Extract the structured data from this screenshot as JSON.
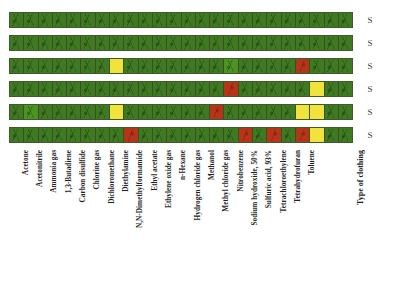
{
  "figure": {
    "row_tag_label": "S",
    "column_header": "Type of clothing",
    "colors": {
      "green": "#3f7a22",
      "bright_green": "#4b9424",
      "yellow": "#f2e23c",
      "red": "#b63418",
      "border": "#3d5a28"
    }
  },
  "chart_data": {
    "type": "heatmap",
    "title": "",
    "xlabel": "",
    "ylabel": "",
    "legend": [],
    "grid": true,
    "row_labels": [
      "S",
      "S",
      "S",
      "S",
      "S",
      "S"
    ],
    "categories": [
      "Acetone",
      "Acetonitrile",
      "Ammonia gas",
      "1,3-Butadiene",
      "Carbon disulfide",
      "Chlorine gas",
      "Dichloromethane",
      "Diethylamine",
      "N,N-Dimethylformamide",
      "Ethyl acetate",
      "Ethylene oxide gas",
      "n-Hexane",
      "Hydrogen chloride gas",
      "Methanol",
      "Methyl chloride gas",
      "Nitrobenzene",
      "Sodium hydroxide, 50%",
      "Sulfuric acid, 93%",
      "Tetrachloroethylene",
      "Tetrahydrofuran",
      "Toluene"
    ],
    "column_count": 24,
    "cell_states": [
      [
        "green",
        "green",
        "green",
        "green",
        "green",
        "green",
        "green",
        "green",
        "green",
        "green",
        "green",
        "green",
        "green",
        "green",
        "green",
        "green",
        "green",
        "green",
        "green",
        "green",
        "green",
        "green",
        "green",
        "green"
      ],
      [
        "green",
        "green",
        "green",
        "green",
        "green",
        "green",
        "green",
        "green",
        "green",
        "green",
        "green",
        "green",
        "green",
        "green",
        "green",
        "green",
        "green",
        "green",
        "green",
        "green",
        "green",
        "green",
        "green",
        "green"
      ],
      [
        "green",
        "green",
        "green",
        "green",
        "green",
        "green",
        "green",
        "yellow",
        "green",
        "green",
        "green",
        "green",
        "green",
        "green",
        "green",
        "bright_green",
        "green",
        "green",
        "green",
        "green",
        "red",
        "green",
        "green",
        "green"
      ],
      [
        "green",
        "green",
        "green",
        "green",
        "green",
        "green",
        "green",
        "green",
        "green",
        "green",
        "green",
        "green",
        "green",
        "green",
        "green",
        "red",
        "green",
        "green",
        "green",
        "green",
        "green",
        "yellow",
        "green",
        "green"
      ],
      [
        "green",
        "bright_green",
        "green",
        "green",
        "green",
        "green",
        "green",
        "yellow",
        "green",
        "green",
        "green",
        "green",
        "green",
        "green",
        "red",
        "green",
        "green",
        "green",
        "green",
        "green",
        "yellow",
        "yellow",
        "green",
        "green"
      ],
      [
        "green",
        "green",
        "green",
        "green",
        "green",
        "green",
        "green",
        "green",
        "red",
        "green",
        "green",
        "green",
        "green",
        "green",
        "green",
        "green",
        "red",
        "green",
        "red",
        "green",
        "red",
        "yellow",
        "green",
        "green"
      ]
    ]
  }
}
